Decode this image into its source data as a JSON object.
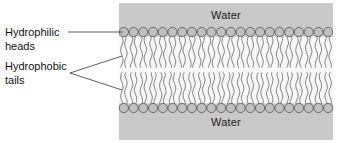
{
  "figure": {
    "background_color": "#ffffff",
    "width": 340,
    "height": 143
  },
  "membrane": {
    "panel_color": "#c9c9c9",
    "panel_x": 119,
    "panel_y": 3,
    "panel_width": 214,
    "panel_height": 137,
    "water_top_label": "Water",
    "water_bottom_label": "Water",
    "head_count_per_leaflet": 22,
    "head_fill_color": "#c0c0c0",
    "head_stroke_color": "#555555",
    "head_radius": 4.6,
    "tail_color": "#666666",
    "tails_per_head": 2,
    "leaflet_top_head_y": 32,
    "leaflet_bottom_head_y": 108,
    "tail_core_color": "#f7f7f7"
  },
  "callouts": [
    {
      "id": "hydrophilic",
      "line1": "Hydrophilic",
      "line2": "heads",
      "leader_type": "straight",
      "target_x": 123,
      "target_y": 32
    },
    {
      "id": "hydrophobic",
      "line1": "Hydrophobic",
      "line2": "tails",
      "leader_type": "forked",
      "apex_x": 70,
      "apex_y": 73,
      "target_upper_y": 56,
      "target_lower_y": 90
    }
  ],
  "colors": {
    "text": "#111111",
    "leader_line": "#4a4a4a",
    "panel_gray": "#c9c9c9"
  }
}
